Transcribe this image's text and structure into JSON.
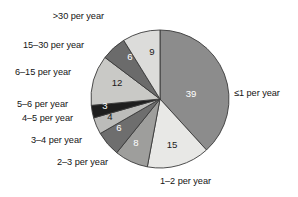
{
  "chart_data": {
    "type": "pie",
    "title": "",
    "subtitle": "",
    "xlabel": "",
    "ylabel": "",
    "legend_position": "callout-labels-around-pie",
    "grid": false,
    "start_angle_deg": 0,
    "direction": "clockwise",
    "total": 102,
    "categories": [
      "≤1 per year",
      "1–2 per year",
      "2–3 per year",
      "3–4 per year",
      "4–5 per year",
      "5–6 per year",
      "6–15 per year",
      "15–30 per year",
      ">30 per year"
    ],
    "values": [
      39,
      15,
      8,
      6,
      4,
      3,
      12,
      6,
      9
    ],
    "value_labels": [
      "39",
      "15",
      "8",
      "6",
      "4",
      "3",
      "12",
      "6",
      "9"
    ],
    "slice_colors": [
      "#8c8c8c",
      "#e8e8e6",
      "#9e9e9c",
      "#6e6e6e",
      "#bcbcba",
      "#1e1e1e",
      "#c9c9c6",
      "#6b6b6b",
      "#dcdcda"
    ],
    "value_label_colors": [
      "#ffffff",
      "#1a1a1a",
      "#ffffff",
      "#ffffff",
      "#1a1a1a",
      "#ffffff",
      "#1a1a1a",
      "#ffffff",
      "#1a1a1a"
    ],
    "slice_outline_color": "#3a3a3a",
    "background_color": "#ffffff",
    "text_color": "#141414"
  },
  "pie": {
    "center_x": 160,
    "center_y": 99,
    "radius": 69,
    "slices": [
      {
        "label": "≤1 per year",
        "value": 39,
        "value_text": "39",
        "value_x": 191,
        "value_y": 94,
        "color": "#8c8c8c",
        "text_color": "#ffffff"
      },
      {
        "label": "1–2 per year",
        "value": 15,
        "value_text": "15",
        "value_x": 172,
        "value_y": 145,
        "color": "#e8e8e6",
        "text_color": "#1a1a1a"
      },
      {
        "label": "2–3 per year",
        "value": 8,
        "value_text": "8",
        "value_x": 136,
        "value_y": 143,
        "color": "#9e9e9c",
        "text_color": "#ffffff"
      },
      {
        "label": "3–4 per year",
        "value": 6,
        "value_text": "6",
        "value_x": 119,
        "value_y": 128,
        "color": "#6e6e6e",
        "text_color": "#ffffff"
      },
      {
        "label": "4–5 per year",
        "value": 4,
        "value_text": "4",
        "value_x": 110,
        "value_y": 117,
        "color": "#bcbcba",
        "text_color": "#1a1a1a"
      },
      {
        "label": "5–6 per year",
        "value": 3,
        "value_text": "3",
        "value_x": 105,
        "value_y": 106,
        "color": "#1e1e1e",
        "text_color": "#ffffff"
      },
      {
        "label": "6–15 per year",
        "value": 12,
        "value_text": "12",
        "value_x": 117,
        "value_y": 83,
        "color": "#c9c9c6",
        "text_color": "#1a1a1a"
      },
      {
        "label": "15–30 per year",
        "value": 6,
        "value_text": "6",
        "value_x": 130,
        "value_y": 57,
        "color": "#6b6b6b",
        "text_color": "#ffffff"
      },
      {
        "label": ">30 per year",
        "value": 9,
        "value_text": "9",
        "value_x": 152,
        "value_y": 52,
        "color": "#dcdcda",
        "text_color": "#1a1a1a"
      }
    ]
  },
  "labels": {
    "gt30": {
      "text": ">30 per year",
      "x": 104,
      "y": 11,
      "align": "left"
    },
    "l15_30": {
      "text": "15–30 per year",
      "x": 23,
      "y": 40,
      "align": "left"
    },
    "l6_15": {
      "text": "6–15 per year",
      "x": 15,
      "y": 67,
      "align": "left"
    },
    "l5_6": {
      "text": "5–6 per year",
      "x": 17,
      "y": 99,
      "align": "left"
    },
    "l4_5": {
      "text": "4–5 per year",
      "x": 22,
      "y": 113,
      "align": "left"
    },
    "l3_4": {
      "text": "3–4 per year",
      "x": 31,
      "y": 135,
      "align": "left"
    },
    "l2_3": {
      "text": "2–3 per year",
      "x": 57,
      "y": 157,
      "align": "left"
    },
    "l1_2": {
      "text": "1–2 per year",
      "x": 160,
      "y": 176,
      "align": "left"
    },
    "le1": {
      "text": "≤1 per year",
      "x": 234,
      "y": 88,
      "align": "left"
    }
  }
}
